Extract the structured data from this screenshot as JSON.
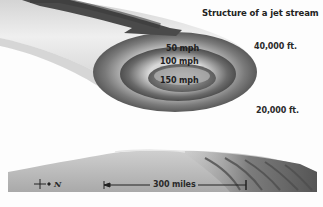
{
  "diagram": {
    "title": "Structure of a jet stream",
    "altitudes": [
      {
        "label": "40,000 ft."
      },
      {
        "label": "20,000 ft."
      }
    ],
    "speed_bands": [
      {
        "label": "50 mph"
      },
      {
        "label": "100 mph"
      },
      {
        "label": "150 mph"
      }
    ],
    "scale": {
      "label": "300 miles"
    },
    "compass": {
      "label": "N",
      "icon": "north-arrow-icon"
    },
    "flow_arrow": {
      "icon": "arrow-right-icon",
      "direction": "east"
    },
    "colors": {
      "background": "#fdfdfd",
      "stream_light": "#e8e8e8",
      "stream_dark": "#5a5a5a",
      "ground": "#b8b8b8",
      "text": "#222222"
    }
  }
}
